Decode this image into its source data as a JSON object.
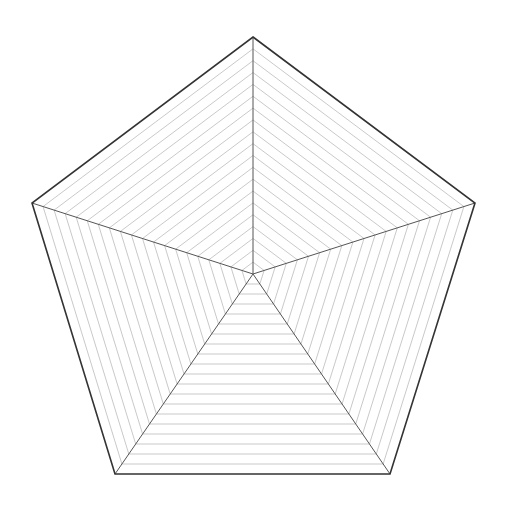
{
  "figure": {
    "type": "pentagon-radar-grid",
    "width": 508,
    "height": 508,
    "background": "#ffffff",
    "center": [
      253,
      274
    ],
    "vertices": [
      [
        253,
        37
      ],
      [
        475,
        203
      ],
      [
        390,
        474
      ],
      [
        115,
        474
      ],
      [
        32,
        203
      ]
    ],
    "levels": 20,
    "colors": {
      "outline": "#333333",
      "spokes": "#555555",
      "grid": "#bbbbbb"
    },
    "stroke_widths": {
      "outline": 1.6,
      "spokes": 1.0,
      "grid": 0.8
    }
  }
}
